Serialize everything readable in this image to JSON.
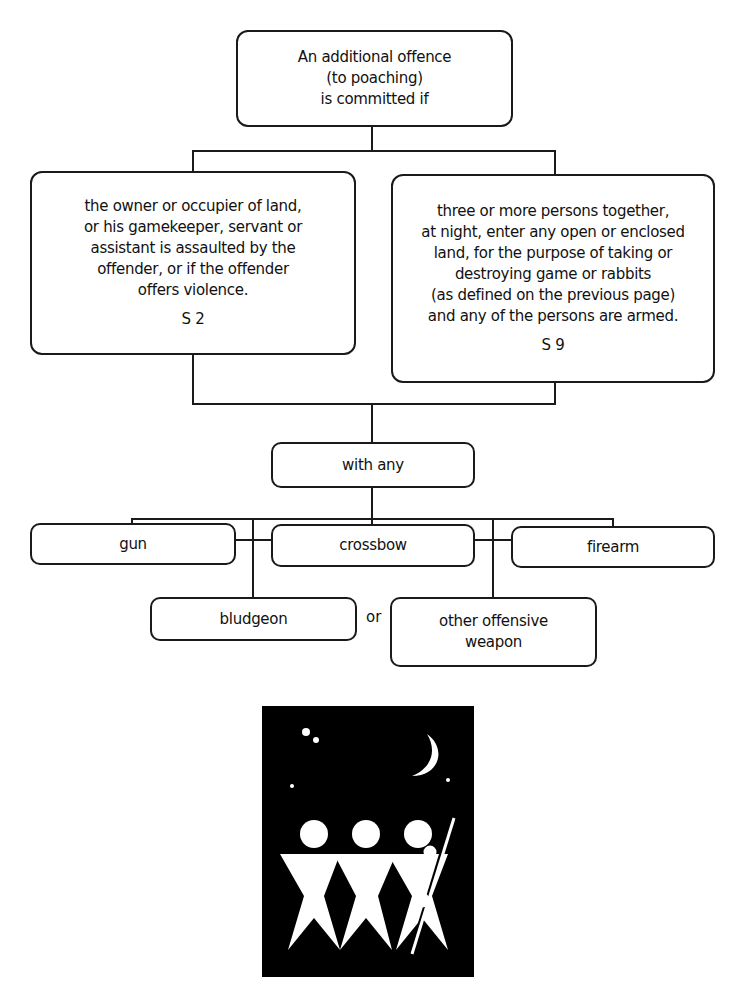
{
  "diagram": {
    "root": {
      "lines": [
        "An additional offence",
        "(to poaching)",
        "is committed if"
      ]
    },
    "branches": [
      {
        "lines": [
          "the owner or occupier of land,",
          "or his gamekeeper, servant or",
          "assistant is assaulted by the",
          "offender, or if the offender",
          "offers violence."
        ],
        "ref": "S 2"
      },
      {
        "lines": [
          "three or more persons together,",
          "at night, enter any open or enclosed",
          "land, for the purpose of taking or",
          "destroying game or rabbits",
          "(as defined on the previous page)",
          "and any of the persons are armed."
        ],
        "ref": "S 9"
      }
    ],
    "join": {
      "label": "with any"
    },
    "weapons": [
      {
        "label": "gun"
      },
      {
        "label": "crossbow"
      },
      {
        "label": "firearm"
      },
      {
        "label": "bludgeon"
      },
      {
        "label": "other offensive weapon",
        "lines": [
          "other offensive",
          "weapon"
        ]
      }
    ],
    "connector_word": "or"
  },
  "illustration": {
    "description": "three armed figures at night under a crescent moon",
    "colors": {
      "background": "#000000",
      "foreground": "#ffffff"
    }
  }
}
